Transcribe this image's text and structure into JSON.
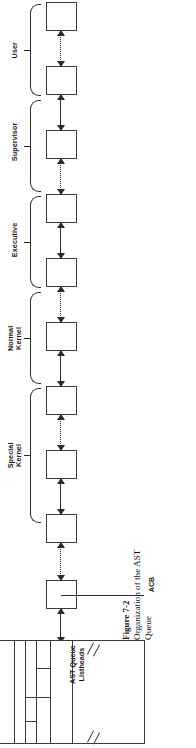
{
  "figure": {
    "caption_number": "Figure 7-2",
    "caption_text": "Organization of the AST Queue",
    "orientation": "rotated-90-ccw"
  },
  "diagram": {
    "node_label": "",
    "node_count": 10,
    "callout": {
      "label": "ACB",
      "target_node_index": 9
    },
    "groups": [
      {
        "label": "User",
        "nodes": [
          0,
          1
        ]
      },
      {
        "label": "Supervisor",
        "nodes": [
          2,
          3
        ]
      },
      {
        "label": "Executive",
        "nodes": [
          4,
          5
        ]
      },
      {
        "label": "Normal\nKernel",
        "nodes": [
          6,
          7
        ]
      },
      {
        "label": "Special\nKernel",
        "nodes": [
          8,
          9
        ]
      }
    ],
    "connector_styles": [
      "dotted",
      "solid",
      "dotted",
      "solid",
      "dotted",
      "solid",
      "dotted",
      "solid",
      "dotted"
    ],
    "queue_table": {
      "label": "AST Queue\nListheads",
      "break_marks": 2
    }
  },
  "colors": {
    "stroke": "#3a3a3a",
    "line": "#2b2b2b",
    "background": "#ffffff",
    "text": "#111111"
  }
}
